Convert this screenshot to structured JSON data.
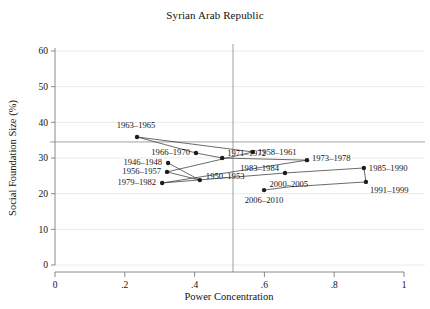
{
  "chart_data": {
    "type": "scatter",
    "title": "Syrian Arab Republic",
    "xlabel": "Power Concentration",
    "ylabel": "Social Foundation Size (%)",
    "xlim": [
      0,
      1
    ],
    "ylim": [
      0,
      63
    ],
    "grid": true,
    "legend": "none",
    "xticks": [
      0,
      0.2,
      0.4,
      0.6,
      0.8,
      1
    ],
    "xticklabels": [
      "0",
      ".2",
      ".4",
      ".6",
      ".8",
      "1"
    ],
    "yticks": [
      0,
      10,
      20,
      30,
      40,
      50,
      60
    ],
    "yticklabels": [
      "0",
      "10",
      "20",
      "30",
      "40",
      "50",
      "60"
    ],
    "reference_lines": [
      {
        "orientation": "horizontal",
        "value": 34.5
      },
      {
        "orientation": "vertical",
        "value": 0.51
      }
    ],
    "points": [
      {
        "label": "1963–1965",
        "x": 0.235,
        "y": 35.9,
        "label_dx": -1,
        "label_dy": -9,
        "label_anchor": "middle"
      },
      {
        "label": "1966–1970",
        "x": 0.404,
        "y": 31.4,
        "label_dx": -6,
        "label_dy": 2,
        "label_anchor": "end"
      },
      {
        "label": "1971–1972",
        "x": 0.479,
        "y": 30.0,
        "label_dx": 5,
        "label_dy": -2,
        "label_anchor": "start"
      },
      {
        "label": "1958–1961",
        "x": 0.567,
        "y": 31.7,
        "label_dx": 5,
        "label_dy": 3,
        "label_anchor": "start"
      },
      {
        "label": "1973–1978",
        "x": 0.722,
        "y": 29.4,
        "label_dx": 5,
        "label_dy": 1,
        "label_anchor": "start"
      },
      {
        "label": "1985–1990",
        "x": 0.885,
        "y": 27.2,
        "label_dx": 5,
        "label_dy": 3,
        "label_anchor": "start"
      },
      {
        "label": "1991–1999",
        "x": 0.891,
        "y": 23.3,
        "label_dx": 4,
        "label_dy": 11,
        "label_anchor": "start"
      },
      {
        "label": "1946–1948",
        "x": 0.324,
        "y": 28.6,
        "label_dx": -6,
        "label_dy": 2,
        "label_anchor": "end"
      },
      {
        "label": "1956–1957",
        "x": 0.321,
        "y": 26.1,
        "label_dx": -6,
        "label_dy": 2,
        "label_anchor": "end"
      },
      {
        "label": "1979–1982",
        "x": 0.307,
        "y": 23.0,
        "label_dx": -6,
        "label_dy": 2,
        "label_anchor": "end"
      },
      {
        "label": "1950–1953",
        "x": 0.415,
        "y": 23.8,
        "label_dx": 6,
        "label_dy": -1,
        "label_anchor": "start"
      },
      {
        "label": "1983–1984",
        "x": 0.659,
        "y": 25.8,
        "label_dx": -6,
        "label_dy": -2,
        "label_anchor": "end"
      },
      {
        "label": "2006–2010",
        "x": 0.599,
        "y": 21.0,
        "label_dx": 0,
        "label_dy": 13,
        "label_anchor": "middle"
      }
    ],
    "connection_order": [
      "1946–1948",
      "1950–1953",
      "1956–1957",
      "1958–1961",
      "1963–1965",
      "1966–1970",
      "1971–1972",
      "1973–1978",
      "1979–1982",
      "1983–1984",
      "1985–1990",
      "1991–1999",
      "2000–2005",
      "2006–2010"
    ],
    "extra_labels": [
      {
        "text": "2000–2005",
        "x": 0.67,
        "y": 21.9,
        "anchor": "middle"
      }
    ]
  },
  "colors": {
    "marker": "#1c1c1c",
    "line": "#3a3a3a",
    "grid": "#e2e2e4",
    "axis": "#6d6d6d",
    "reference": "#8a8a8a",
    "background": "#ffffff"
  }
}
